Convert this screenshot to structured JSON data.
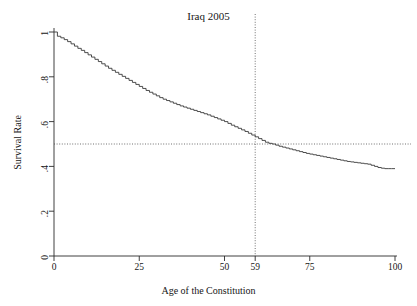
{
  "chart_data": {
    "type": "line",
    "title": "Iraq 2005",
    "subtitle": "",
    "xlabel": "Age of the Constitution",
    "ylabel": "Survival Rate",
    "xlim": [
      0,
      100
    ],
    "ylim": [
      0,
      1
    ],
    "grid": false,
    "legend": null,
    "curve_style": "step",
    "xticks": [
      {
        "value": 0,
        "label": "0"
      },
      {
        "value": 25,
        "label": "25"
      },
      {
        "value": 50,
        "label": "50"
      },
      {
        "value": 59,
        "label": "59"
      },
      {
        "value": 75,
        "label": "75"
      },
      {
        "value": 100,
        "label": "100"
      }
    ],
    "yticks": [
      {
        "value": 0,
        "label": "0"
      },
      {
        "value": 0.2,
        "label": ".2"
      },
      {
        "value": 0.4,
        "label": ".4"
      },
      {
        "value": 0.6,
        "label": ".6"
      },
      {
        "value": 0.8,
        "label": ".8"
      },
      {
        "value": 1,
        "label": "1"
      }
    ],
    "reference_lines": [
      {
        "name": "median-survival-horizontal",
        "orientation": "horizontal",
        "value": 0.5,
        "style": "dotted"
      },
      {
        "name": "median-age-vertical",
        "orientation": "vertical",
        "value": 59,
        "style": "dotted"
      }
    ],
    "annotations": [
      {
        "name": "median-age",
        "x": 59,
        "y": 0.5,
        "text": "59"
      }
    ],
    "series": [
      {
        "name": "Survival Rate",
        "color": "#3a3a3a",
        "x": [
          0,
          1,
          2,
          3,
          4,
          5,
          6,
          7,
          8,
          9,
          10,
          11,
          12,
          13,
          14,
          15,
          16,
          17,
          18,
          19,
          20,
          21,
          22,
          23,
          24,
          25,
          26,
          27,
          28,
          29,
          30,
          31,
          32,
          33,
          34,
          35,
          36,
          37,
          38,
          39,
          40,
          41,
          42,
          43,
          44,
          45,
          46,
          47,
          48,
          49,
          50,
          51,
          52,
          53,
          54,
          55,
          56,
          57,
          58,
          59,
          60,
          61,
          62,
          63,
          64,
          65,
          66,
          67,
          68,
          69,
          70,
          71,
          72,
          73,
          74,
          75,
          76,
          77,
          78,
          79,
          80,
          81,
          82,
          83,
          84,
          85,
          86,
          87,
          88,
          89,
          90,
          91,
          92,
          93,
          94,
          95,
          96,
          97,
          98,
          99,
          100
        ],
        "y": [
          1.0,
          0.981,
          0.974,
          0.966,
          0.957,
          0.947,
          0.937,
          0.927,
          0.918,
          0.908,
          0.898,
          0.888,
          0.878,
          0.868,
          0.858,
          0.848,
          0.838,
          0.829,
          0.82,
          0.811,
          0.802,
          0.793,
          0.784,
          0.775,
          0.766,
          0.757,
          0.748,
          0.739,
          0.731,
          0.723,
          0.715,
          0.707,
          0.7,
          0.694,
          0.688,
          0.682,
          0.676,
          0.67,
          0.665,
          0.66,
          0.655,
          0.65,
          0.645,
          0.64,
          0.635,
          0.63,
          0.624,
          0.618,
          0.612,
          0.606,
          0.6,
          0.592,
          0.584,
          0.577,
          0.57,
          0.563,
          0.556,
          0.548,
          0.54,
          0.532,
          0.524,
          0.516,
          0.508,
          0.503,
          0.5,
          0.495,
          0.49,
          0.486,
          0.482,
          0.478,
          0.474,
          0.47,
          0.466,
          0.462,
          0.458,
          0.455,
          0.452,
          0.449,
          0.446,
          0.443,
          0.44,
          0.437,
          0.434,
          0.431,
          0.428,
          0.425,
          0.422,
          0.42,
          0.418,
          0.416,
          0.414,
          0.412,
          0.41,
          0.405,
          0.4,
          0.395,
          0.392,
          0.39,
          0.39,
          0.39,
          0.39
        ]
      }
    ]
  }
}
